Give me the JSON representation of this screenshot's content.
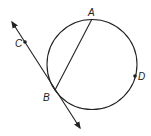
{
  "diagram": {
    "circle": {
      "cx": 92,
      "cy": 64.5,
      "r": 45
    },
    "points": [
      {
        "label": "A",
        "x": 92,
        "y": 19,
        "lx": 88,
        "ly": 16
      },
      {
        "label": "B",
        "x": 55,
        "y": 90,
        "lx": 43,
        "ly": 101
      },
      {
        "label": "C",
        "x": 25,
        "y": 42,
        "lx": 15,
        "ly": 47
      },
      {
        "label": "D",
        "x": 135,
        "y": 76,
        "lx": 138,
        "ly": 80
      }
    ],
    "chord": {
      "from": "A",
      "to": "B"
    },
    "line": {
      "x1": 12,
      "y1": 22,
      "x2": 80,
      "y2": 128,
      "through": [
        "C",
        "B"
      ]
    }
  }
}
